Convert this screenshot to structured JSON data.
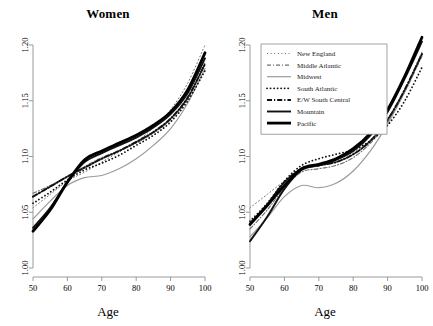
{
  "figure": {
    "panels": [
      {
        "name": "women",
        "title": "Women",
        "xlabel": "Age"
      },
      {
        "name": "men",
        "title": "Men",
        "xlabel": "Age"
      }
    ]
  },
  "legend": {
    "position": "top-left-of-right-panel",
    "entries": [
      {
        "label": "New England",
        "style": "dotted-sparse",
        "color": "#6f6f6f",
        "width": 1.0
      },
      {
        "label": "Middle Atlantic",
        "style": "dash-dot",
        "color": "#6f6f6f",
        "width": 1.1
      },
      {
        "label": "Midwest",
        "style": "solid",
        "color": "#9b9b9b",
        "width": 1.2
      },
      {
        "label": "South Atlantic",
        "style": "dotted-bold",
        "color": "#111111",
        "width": 1.8
      },
      {
        "label": "E/W South Central",
        "style": "dash-dot-bold",
        "color": "#111111",
        "width": 2.0
      },
      {
        "label": "Mountain",
        "style": "solid",
        "color": "#111111",
        "width": 1.9
      },
      {
        "label": "Pacific",
        "style": "solid-thick",
        "color": "#000000",
        "width": 2.8
      }
    ]
  },
  "chart_data": {
    "type": "line",
    "title": "",
    "xlabel": "Age",
    "ylabel": "",
    "xlim": [
      50,
      100
    ],
    "ylim": [
      1.0,
      1.2
    ],
    "xticks": [
      50,
      60,
      70,
      80,
      90,
      100
    ],
    "yticks": [
      "1.00",
      "1.05",
      "1.10",
      "1.15",
      "1.20"
    ],
    "grid": false,
    "x": [
      50,
      55,
      60,
      65,
      70,
      75,
      80,
      85,
      90,
      95,
      100
    ],
    "panels": [
      {
        "name": "Women",
        "series": [
          {
            "name": "New England",
            "values": [
              1.054,
              1.066,
              1.078,
              1.086,
              1.095,
              1.104,
              1.113,
              1.126,
              1.142,
              1.166,
              1.2
            ]
          },
          {
            "name": "Middle Atlantic",
            "values": [
              1.067,
              1.074,
              1.082,
              1.091,
              1.099,
              1.105,
              1.112,
              1.121,
              1.133,
              1.152,
              1.184
            ]
          },
          {
            "name": "Midwest",
            "values": [
              1.044,
              1.06,
              1.074,
              1.081,
              1.083,
              1.089,
              1.098,
              1.11,
              1.125,
              1.148,
              1.179
            ]
          },
          {
            "name": "South Atlantic",
            "values": [
              1.058,
              1.068,
              1.079,
              1.088,
              1.094,
              1.101,
              1.11,
              1.119,
              1.131,
              1.15,
              1.177
            ]
          },
          {
            "name": "E/W South Central",
            "values": [
              1.064,
              1.073,
              1.082,
              1.09,
              1.098,
              1.105,
              1.113,
              1.122,
              1.134,
              1.153,
              1.183
            ]
          },
          {
            "name": "Mountain",
            "values": [
              1.036,
              1.054,
              1.077,
              1.095,
              1.103,
              1.11,
              1.117,
              1.126,
              1.138,
              1.157,
              1.188
            ]
          },
          {
            "name": "Pacific",
            "values": [
              1.033,
              1.052,
              1.077,
              1.097,
              1.105,
              1.112,
              1.119,
              1.128,
              1.14,
              1.16,
              1.193
            ]
          }
        ]
      },
      {
        "name": "Men",
        "series": [
          {
            "name": "New England",
            "values": [
              1.054,
              1.066,
              1.078,
              1.088,
              1.093,
              1.098,
              1.104,
              1.115,
              1.133,
              1.16,
              1.194
            ]
          },
          {
            "name": "Middle Atlantic",
            "values": [
              1.035,
              1.052,
              1.072,
              1.086,
              1.089,
              1.092,
              1.099,
              1.112,
              1.131,
              1.158,
              1.19
            ]
          },
          {
            "name": "Midwest",
            "values": [
              1.028,
              1.045,
              1.064,
              1.074,
              1.072,
              1.076,
              1.087,
              1.105,
              1.129,
              1.158,
              1.192
            ]
          },
          {
            "name": "South Atlantic",
            "values": [
              1.042,
              1.058,
              1.078,
              1.092,
              1.098,
              1.102,
              1.106,
              1.114,
              1.128,
              1.15,
              1.18
            ]
          },
          {
            "name": "E/W South Central",
            "values": [
              1.04,
              1.057,
              1.077,
              1.089,
              1.092,
              1.095,
              1.102,
              1.114,
              1.133,
              1.16,
              1.192
            ]
          },
          {
            "name": "Mountain",
            "values": [
              1.024,
              1.046,
              1.071,
              1.088,
              1.092,
              1.097,
              1.105,
              1.119,
              1.14,
              1.17,
              1.203
            ]
          },
          {
            "name": "Pacific",
            "values": [
              1.039,
              1.056,
              1.074,
              1.089,
              1.093,
              1.098,
              1.107,
              1.121,
              1.142,
              1.172,
              1.207
            ]
          }
        ]
      }
    ]
  }
}
